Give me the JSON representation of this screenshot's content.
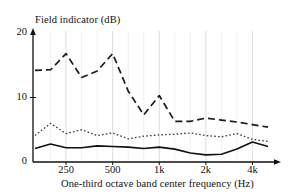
{
  "chart_data": {
    "type": "line",
    "title": "",
    "ylabel": "Field indicator (dB)",
    "xlabel": "One-third octave band center frequency (Hz)",
    "ylim": [
      0,
      20
    ],
    "yticks": [
      0,
      10,
      20
    ],
    "ytick_labels": [
      "0",
      "10",
      "20"
    ],
    "xtick_labels": [
      "250",
      "500",
      "1k",
      "2k",
      "4k"
    ],
    "xticks_hz": [
      250,
      500,
      1000,
      2000,
      4000
    ],
    "grid": "vertical-only",
    "legend": "none",
    "x_categories": [
      160,
      200,
      250,
      315,
      400,
      500,
      630,
      800,
      1000,
      1250,
      1600,
      2000,
      2500,
      3150,
      4000,
      5000
    ],
    "series": [
      {
        "name": "dashed-series",
        "style": "dashed",
        "color": "#1a1a1a",
        "values": [
          14.2,
          14.3,
          16.8,
          13.1,
          14.1,
          16.8,
          11.0,
          7.3,
          10.3,
          6.3,
          6.3,
          6.8,
          6.5,
          6.2,
          5.8,
          5.4
        ]
      },
      {
        "name": "dotted-series",
        "style": "dotted",
        "color": "#3a3a3a",
        "values": [
          4.1,
          6.0,
          4.4,
          5.0,
          4.1,
          4.5,
          3.6,
          4.0,
          4.2,
          4.3,
          4.5,
          4.1,
          3.9,
          4.4,
          3.5,
          3.2
        ]
      },
      {
        "name": "solid-series",
        "style": "solid",
        "color": "#111111",
        "values": [
          2.1,
          2.8,
          2.2,
          2.2,
          2.5,
          2.4,
          2.3,
          2.1,
          2.3,
          2.0,
          1.4,
          1.1,
          1.2,
          2.0,
          3.1,
          2.4
        ]
      }
    ]
  },
  "axes": {
    "y_axis_name": "field-indicator-axis",
    "x_axis_name": "frequency-axis"
  }
}
